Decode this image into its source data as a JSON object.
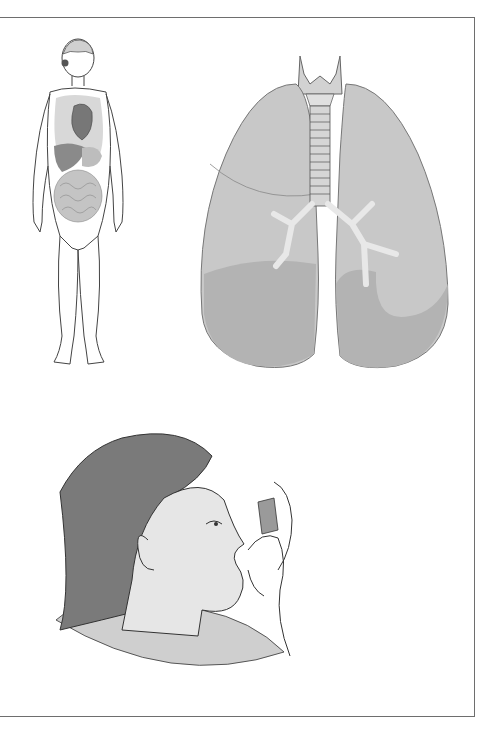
{
  "figure": {
    "panels": [
      {
        "id": "body",
        "description": "Human body outline with internal organs (brain, lungs, heart, liver, stomach, intestines)"
      },
      {
        "id": "lungs",
        "description": "Lungs with larynx, trachea, bronchi and lobes"
      },
      {
        "id": "inhaler",
        "description": "Person using a metered-dose inhaler"
      }
    ],
    "colors": {
      "frame": "#6e6e6e",
      "lung_fill": "#c8c8c8",
      "lung_lower": "#b0b0b0",
      "hair": "#7a7a7a",
      "skin": "#e6e6e6",
      "shirt": "#cfcfcf",
      "line": "#333333"
    }
  }
}
